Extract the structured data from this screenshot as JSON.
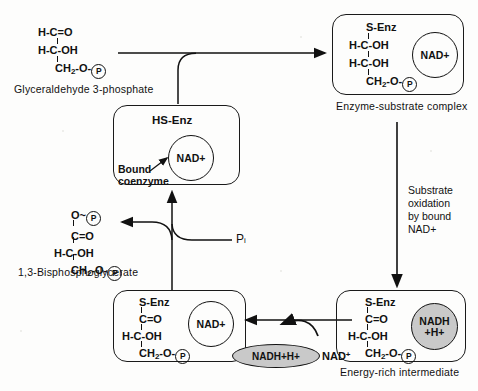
{
  "figure": {
    "background_color": "#fdfdfc",
    "ink_color": "#111111",
    "shaded_fill": "#c9c9c9"
  },
  "substrate": {
    "line1": "H-C=O",
    "line2": "H-C-OH",
    "line3_pre": "CH",
    "line3_sub": "2",
    "line3_post": "-O-",
    "phosphate": "P",
    "label": "Glyceraldehyde 3-phosphate"
  },
  "enzyme_box": {
    "title": "HS-Enz",
    "cofactor": "NAD",
    "cofactor_charge": "+",
    "annotation_line1": "Bound",
    "annotation_line2": "coenzyme"
  },
  "es_complex": {
    "line1": "S-Enz",
    "line2": "H-C-OH",
    "line3": "H-C-OH",
    "line4_pre": "CH",
    "line4_sub": "2",
    "line4_post": "-O-",
    "phosphate": "P",
    "cofactor": "NAD",
    "cofactor_charge": "+",
    "caption": "Enzyme-substrate complex"
  },
  "oxidation_note": {
    "line1": "Substrate",
    "line2": "oxidation",
    "line3": "by bound",
    "line4": "NAD",
    "line4_charge": "+"
  },
  "energy_rich": {
    "line1": "S-Enz",
    "line2": "C=O",
    "line3": "H-C-OH",
    "line4_pre": "CH",
    "line4_sub": "2",
    "line4_post": "-O-",
    "phosphate": "P",
    "cofactor_line1": "NADH",
    "cofactor_line2": "+H",
    "cofactor_charge": "+",
    "caption": "Energy-rich intermediate"
  },
  "thioester": {
    "line1": "S-Enz",
    "line2": "C=O",
    "line3": "H-C-OH",
    "line4_pre": "CH",
    "line4_sub": "2",
    "line4_post": "-O-",
    "phosphate": "P",
    "cofactor": "NAD",
    "cofactor_charge": "+"
  },
  "exchange": {
    "released": "NADH+H",
    "released_charge": "+",
    "bound": "NAD",
    "bound_charge": "+"
  },
  "product": {
    "line1_pre": "O~",
    "phosphate_top": "P",
    "line2": "C=O",
    "line3": "H-C-OH",
    "line4_pre": "CH",
    "line4_sub": "2",
    "line4_post": "-O-",
    "phosphate_bottom": "P",
    "label": "1,3-Bisphosphoglycerate"
  },
  "inorganic_phosphate": {
    "symbol": "P",
    "subscript": "i"
  }
}
